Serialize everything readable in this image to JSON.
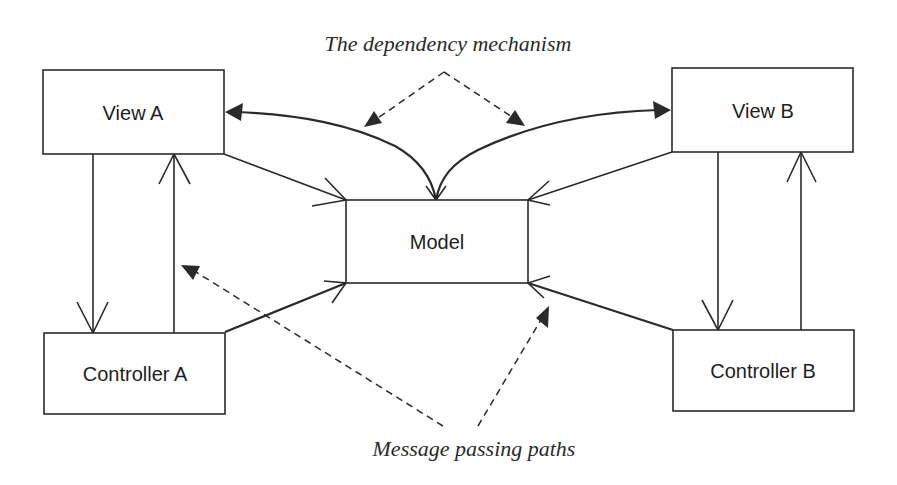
{
  "diagram": {
    "nodes": {
      "view_a": "View A",
      "view_b": "View B",
      "model": "Model",
      "controller_a": "Controller A",
      "controller_b": "Controller B"
    },
    "captions": {
      "dependency": "The dependency mechanism",
      "message_passing": "Message passing paths"
    },
    "edges": [
      {
        "from": "Model",
        "to": "View A",
        "style": "solid-curve",
        "kind": "dependency"
      },
      {
        "from": "Model",
        "to": "View B",
        "style": "solid-curve",
        "kind": "dependency"
      },
      {
        "from": "View A",
        "to": "Model",
        "style": "solid",
        "kind": "message"
      },
      {
        "from": "View B",
        "to": "Model",
        "style": "solid",
        "kind": "message"
      },
      {
        "from": "Controller A",
        "to": "Model",
        "style": "solid",
        "kind": "message"
      },
      {
        "from": "Controller B",
        "to": "Model",
        "style": "solid",
        "kind": "message"
      },
      {
        "from": "View A",
        "to": "Controller A",
        "style": "solid",
        "kind": "message"
      },
      {
        "from": "Controller A",
        "to": "View A",
        "style": "solid",
        "kind": "message"
      },
      {
        "from": "View B",
        "to": "Controller B",
        "style": "solid",
        "kind": "message"
      },
      {
        "from": "Controller B",
        "to": "View B",
        "style": "solid",
        "kind": "message"
      }
    ],
    "colors": {
      "stroke": "#2a2a2a",
      "background": "#ffffff"
    }
  }
}
